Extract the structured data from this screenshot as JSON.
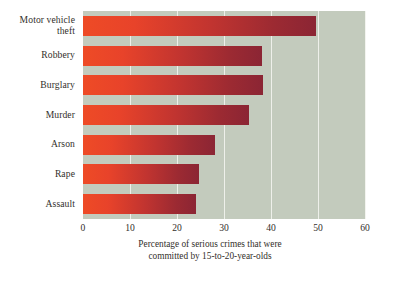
{
  "chart_data": {
    "type": "bar",
    "orientation": "horizontal",
    "title": "",
    "subtitle": "",
    "xlabel": "Percentage of serious crimes that were committed by 15-to-20-year-olds",
    "ylabel": "",
    "categories": [
      "Motor vehicle theft",
      "Robbery",
      "Burglary",
      "Murder",
      "Arson",
      "Rape",
      "Assault"
    ],
    "category_label_lines": [
      [
        "Motor vehicle",
        "theft"
      ],
      [
        "Robbery"
      ],
      [
        "Burglary"
      ],
      [
        "Murder"
      ],
      [
        "Arson"
      ],
      [
        "Rape"
      ],
      [
        "Assault"
      ]
    ],
    "values": [
      49.5,
      38.0,
      38.3,
      35.3,
      28.0,
      24.7,
      24.0
    ],
    "xlim": [
      0,
      60
    ],
    "xticks": [
      0,
      10,
      20,
      30,
      40,
      50,
      60
    ],
    "xtick_labels": [
      "0",
      "10",
      "20",
      "30",
      "40",
      "50",
      "60"
    ],
    "grid": "vertical",
    "legend": "none",
    "colors": {
      "plot_background": "#c3cbbd",
      "gridline": "#f2f3ee",
      "bar_gradient_start": "#ee4b26",
      "bar_gradient_end": "#8b2534",
      "text": "#332f2b",
      "page_background": "#ffffff"
    }
  },
  "caption": {
    "line1": "Percentage of serious crimes that were",
    "line2": "committed by 15-to-20-year-olds"
  }
}
